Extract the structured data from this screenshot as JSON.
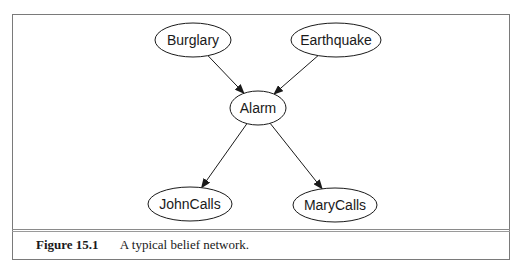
{
  "diagram": {
    "type": "belief-network",
    "nodes": [
      {
        "id": "burglary",
        "label": "Burglary",
        "cx": 193,
        "cy": 40,
        "rx": 38,
        "ry": 17
      },
      {
        "id": "earthquake",
        "label": "Earthquake",
        "cx": 336,
        "cy": 40,
        "rx": 45,
        "ry": 17
      },
      {
        "id": "alarm",
        "label": "Alarm",
        "cx": 258,
        "cy": 108,
        "rx": 28,
        "ry": 17
      },
      {
        "id": "johncalls",
        "label": "JohnCalls",
        "cx": 190,
        "cy": 204,
        "rx": 42,
        "ry": 17
      },
      {
        "id": "marycalls",
        "label": "MaryCalls",
        "cx": 335,
        "cy": 205,
        "rx": 42,
        "ry": 17
      }
    ],
    "edges": [
      {
        "from": "burglary",
        "to": "alarm"
      },
      {
        "from": "earthquake",
        "to": "alarm"
      },
      {
        "from": "alarm",
        "to": "johncalls"
      },
      {
        "from": "alarm",
        "to": "marycalls"
      }
    ]
  },
  "caption": {
    "figure_label": "Figure 15.1",
    "text": "A typical belief network."
  }
}
